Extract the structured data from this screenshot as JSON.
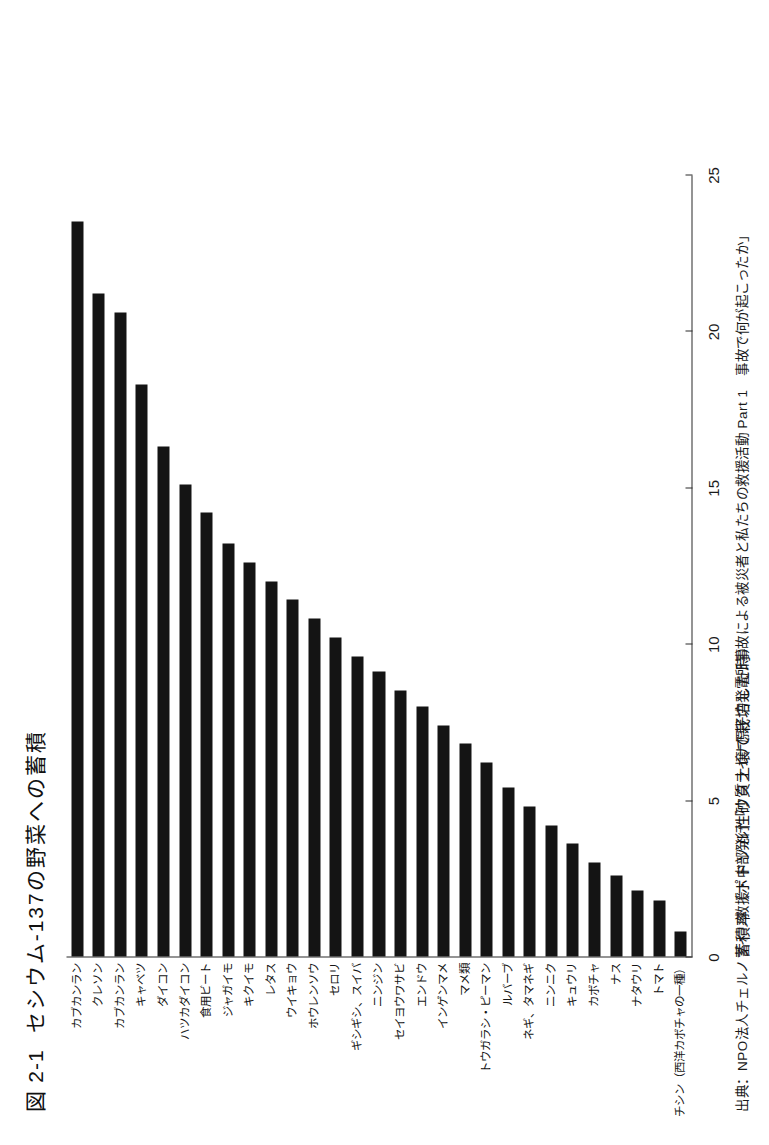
{
  "figure": {
    "label": "図 2-1",
    "title": "セシウム-137の野菜への蓄積",
    "source": "出典：NPO法人チェルノブイリ救援・中部発行「ウクライナ原子力発電所事故による被災者と私たちの救援活動 Part 1　事故で何が起こったか」"
  },
  "chart_data": {
    "type": "bar",
    "orientation": "horizontal",
    "title": "セシウム-137の野菜への蓄積",
    "xlabel": "蓄積率（ポドゾル性砂質土壌で栽培した時）",
    "ylabel": "",
    "xlim": [
      0,
      25
    ],
    "xticks": [
      0,
      5,
      10,
      15,
      20,
      25
    ],
    "xticklabels": [
      "0",
      "5",
      "10",
      "15",
      "20",
      "25"
    ],
    "grid": false,
    "legend": false,
    "bar_color": "#141414",
    "categories": [
      "カブカンラン",
      "クレソン",
      "カブカンラン",
      "キャベツ",
      "ダイコン",
      "ハツカダイコン",
      "食用ビート",
      "ジャガイモ",
      "キクイモ",
      "レタス",
      "ウイキョウ",
      "ホウレンソウ",
      "セロリ",
      "ギシギシ、スイバ",
      "ニンジン",
      "セイヨウワサビ",
      "エンドウ",
      "インゲンマメ",
      "マメ類",
      "トウガラシ・ピーマン",
      "ルバーブ",
      "ネギ、タマネギ",
      "ニンニク",
      "キュウリ",
      "カボチャ",
      "ナス",
      "ナタウリ",
      "トマト",
      "チシン（西洋カボチャの一種）"
    ],
    "values": [
      23.5,
      21.2,
      20.6,
      18.3,
      16.3,
      15.1,
      14.2,
      13.2,
      12.6,
      12.0,
      11.4,
      10.8,
      10.2,
      9.6,
      9.1,
      8.5,
      8.0,
      7.4,
      6.8,
      6.2,
      5.4,
      4.8,
      4.2,
      3.6,
      3.0,
      2.6,
      2.1,
      1.8,
      0.8
    ]
  }
}
